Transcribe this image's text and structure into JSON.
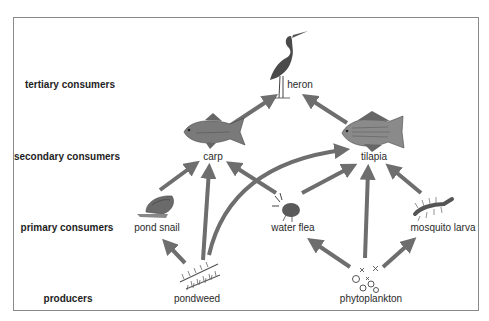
{
  "diagram": {
    "type": "food web",
    "arrow_color": "#6e6e6e",
    "levels": [
      {
        "id": "tertiary",
        "label": "tertiary consumers",
        "x": 70,
        "y": 84
      },
      {
        "id": "secondary",
        "label": "secondary consumers",
        "x": 67,
        "y": 156
      },
      {
        "id": "primary",
        "label": "primary consumers",
        "x": 67,
        "y": 227
      },
      {
        "id": "producers",
        "label": "producers",
        "x": 68,
        "y": 298
      }
    ],
    "organisms": [
      {
        "id": "heron",
        "label": "heron",
        "level": "tertiary",
        "x": 300,
        "y": 84
      },
      {
        "id": "carp",
        "label": "carp",
        "level": "secondary",
        "x": 213,
        "y": 156
      },
      {
        "id": "tilapia",
        "label": "tilapia",
        "level": "secondary",
        "x": 374,
        "y": 156
      },
      {
        "id": "pond_snail",
        "label": "pond snail",
        "level": "primary",
        "x": 157,
        "y": 227
      },
      {
        "id": "water_flea",
        "label": "water flea",
        "level": "primary",
        "x": 293,
        "y": 227
      },
      {
        "id": "mosquito_larva",
        "label": "mosquito larva",
        "level": "primary",
        "x": 443,
        "y": 227
      },
      {
        "id": "pondweed",
        "label": "pondweed",
        "level": "producers",
        "x": 197,
        "y": 298
      },
      {
        "id": "phytoplankton",
        "label": "phytoplankton",
        "level": "producers",
        "x": 371,
        "y": 298
      }
    ],
    "links": [
      {
        "from": "carp",
        "to": "heron"
      },
      {
        "from": "tilapia",
        "to": "heron"
      },
      {
        "from": "pond_snail",
        "to": "carp"
      },
      {
        "from": "pondweed",
        "to": "carp"
      },
      {
        "from": "water_flea",
        "to": "carp"
      },
      {
        "from": "pondweed",
        "to": "tilapia"
      },
      {
        "from": "water_flea",
        "to": "tilapia"
      },
      {
        "from": "phytoplankton",
        "to": "tilapia"
      },
      {
        "from": "mosquito_larva",
        "to": "tilapia"
      },
      {
        "from": "pondweed",
        "to": "pond_snail"
      },
      {
        "from": "phytoplankton",
        "to": "water_flea"
      },
      {
        "from": "phytoplankton",
        "to": "mosquito_larva"
      }
    ]
  }
}
